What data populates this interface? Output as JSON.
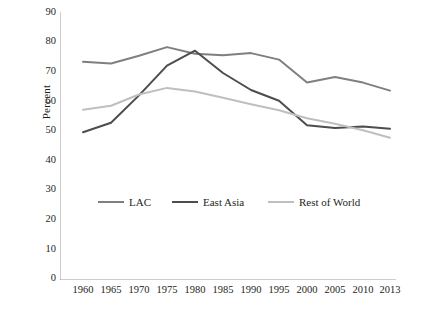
{
  "chart_data": {
    "type": "line",
    "title": "",
    "xlabel": "",
    "ylabel": "Percent",
    "ylim": [
      0,
      90
    ],
    "yticks": [
      0,
      10,
      20,
      30,
      40,
      50,
      60,
      70,
      80,
      90
    ],
    "grid": false,
    "legend_position": "inside-bottom",
    "categories": [
      "1960",
      "1965",
      "1970",
      "1975",
      "1980",
      "1985",
      "1990",
      "1995",
      "2000",
      "2005",
      "2010",
      "2013"
    ],
    "x": [
      1960,
      1965,
      1970,
      1975,
      1980,
      1985,
      1990,
      1995,
      2000,
      2005,
      2010,
      2013
    ],
    "series": [
      {
        "name": "LAC",
        "color": "#7f7f7f",
        "values": [
          73.3,
          72.7,
          75.3,
          78.2,
          76.0,
          75.5,
          76.2,
          74.0,
          66.3,
          68.2,
          66.3,
          63.6
        ]
      },
      {
        "name": "East Asia",
        "color": "#4d4d4d",
        "values": [
          49.6,
          52.8,
          62.0,
          72.0,
          77.0,
          69.5,
          63.8,
          60.2,
          52.0,
          51.0,
          51.5,
          50.8
        ]
      },
      {
        "name": "Rest of World",
        "color": "#bfbfbf",
        "values": [
          57.2,
          58.5,
          62.3,
          64.5,
          63.3,
          61.2,
          59.0,
          57.0,
          54.3,
          52.5,
          50.3,
          47.8
        ]
      }
    ]
  },
  "axis": {
    "y_label": "Percent",
    "y_ticks": [
      "90",
      "80",
      "70",
      "60",
      "50",
      "40",
      "30",
      "20",
      "10",
      "0"
    ],
    "x_ticks": [
      "1960",
      "1965",
      "1970",
      "1975",
      "1980",
      "1985",
      "1990",
      "1995",
      "2000",
      "2005",
      "2010",
      "2013"
    ]
  },
  "legend": {
    "items": [
      {
        "label": "LAC",
        "color": "#7f7f7f"
      },
      {
        "label": "East Asia",
        "color": "#4d4d4d"
      },
      {
        "label": "Rest of World",
        "color": "#bfbfbf"
      }
    ]
  }
}
